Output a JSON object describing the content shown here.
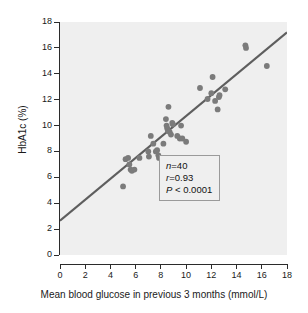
{
  "chart_data": {
    "type": "scatter",
    "title": "",
    "xlabel": "Mean blood glucose in previous 3 months (mmol/L)",
    "ylabel": "HbA1c (%)",
    "xlim": [
      0,
      18
    ],
    "ylim": [
      0,
      18
    ],
    "xticks": [
      0,
      2,
      4,
      6,
      8,
      10,
      12,
      14,
      16,
      18
    ],
    "yticks": [
      0,
      2,
      4,
      6,
      8,
      10,
      12,
      14,
      16,
      18
    ],
    "xtick_labels": [
      "0",
      "2",
      "4",
      "6",
      "8",
      "10",
      "12",
      "14",
      "16",
      "18"
    ],
    "ytick_labels": [
      "0",
      "2",
      "4",
      "6",
      "8",
      "10",
      "12",
      "14",
      "16",
      "18"
    ],
    "grid": false,
    "legend": null,
    "marker_color": "#7b7b7b",
    "plot_background": "#efefef",
    "axis_color": "#2b2b2b",
    "series": [
      {
        "name": "Patients",
        "marker": "circle",
        "color": "#7b7b7b",
        "points": [
          [
            5.0,
            5.3
          ],
          [
            5.2,
            7.4
          ],
          [
            5.4,
            7.5
          ],
          [
            5.5,
            7.0
          ],
          [
            5.6,
            6.6
          ],
          [
            5.7,
            6.5
          ],
          [
            5.9,
            6.6
          ],
          [
            6.3,
            7.5
          ],
          [
            7.0,
            8.0
          ],
          [
            7.05,
            7.6
          ],
          [
            7.2,
            9.2
          ],
          [
            7.4,
            8.6
          ],
          [
            7.6,
            8.0
          ],
          [
            7.7,
            8.1
          ],
          [
            7.8,
            7.7
          ],
          [
            7.85,
            7.5
          ],
          [
            8.2,
            8.6
          ],
          [
            8.4,
            10.5
          ],
          [
            8.45,
            10.0
          ],
          [
            8.5,
            9.8
          ],
          [
            8.55,
            9.6
          ],
          [
            8.6,
            11.45
          ],
          [
            8.7,
            9.5
          ],
          [
            8.8,
            9.3
          ],
          [
            8.9,
            10.2
          ],
          [
            8.95,
            10.1
          ],
          [
            9.3,
            9.2
          ],
          [
            9.5,
            9.0
          ],
          [
            9.6,
            10.0
          ],
          [
            9.7,
            9.0
          ],
          [
            10.0,
            8.75
          ],
          [
            11.1,
            12.9
          ],
          [
            11.7,
            12.05
          ],
          [
            12.0,
            12.5
          ],
          [
            12.1,
            13.75
          ],
          [
            12.3,
            11.9
          ],
          [
            12.5,
            11.25
          ],
          [
            12.6,
            12.2
          ],
          [
            12.65,
            12.35
          ],
          [
            13.1,
            12.8
          ],
          [
            14.7,
            16.2
          ],
          [
            14.75,
            16.0
          ],
          [
            16.4,
            14.6
          ]
        ]
      }
    ],
    "regression_line": {
      "name": "regression-line",
      "color": "#5e5e5e",
      "x_start": 0.0,
      "y_start": 2.65,
      "x_end": 18.0,
      "y_end": 17.2
    },
    "annotations": {
      "stats_box": {
        "n_symbol": "n",
        "n_value": "=40",
        "r_symbol": "r",
        "r_value": "=0.93",
        "p_symbol": "P",
        "p_value": " < 0.0001"
      }
    }
  }
}
